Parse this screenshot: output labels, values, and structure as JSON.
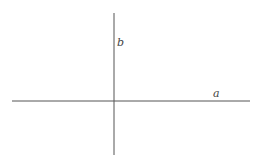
{
  "diagram": {
    "type": "perpendicular-lines",
    "line_color": "#555555",
    "horizontal_line": {
      "label": "a",
      "x1": 12,
      "y1": 101,
      "x2": 250,
      "y2": 101
    },
    "vertical_line": {
      "label": "b",
      "x1": 114,
      "y1": 13,
      "x2": 114,
      "y2": 155
    }
  }
}
